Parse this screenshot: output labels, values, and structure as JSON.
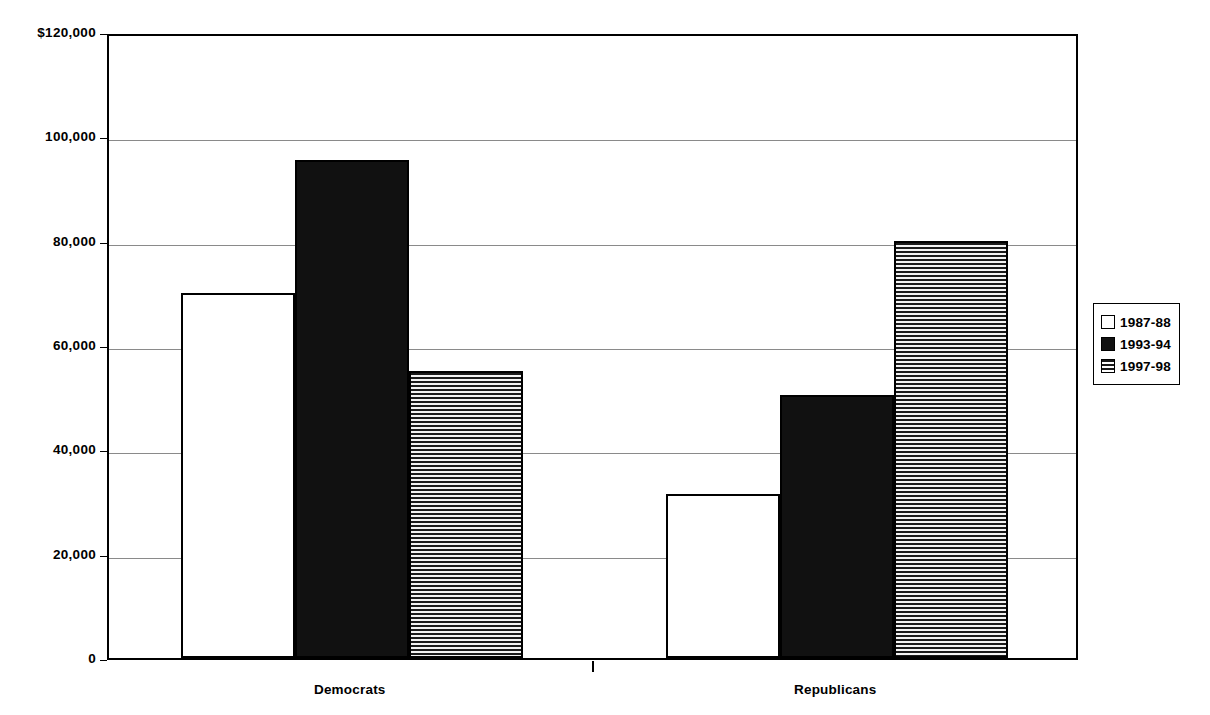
{
  "chart_data": {
    "type": "bar",
    "title": "",
    "subtitle": "",
    "xlabel": "",
    "ylabel": "",
    "categories": [
      "Democrats",
      "Republicans"
    ],
    "series": [
      {
        "name": "1987-88",
        "fill": "white",
        "values": [
          70000,
          31500
        ]
      },
      {
        "name": "1993-94",
        "fill": "black",
        "values": [
          95500,
          50500
        ]
      },
      {
        "name": "1997-98",
        "fill": "hatch",
        "values": [
          55000,
          80000
        ]
      }
    ],
    "ylim": [
      0,
      120000
    ],
    "ytick_values": [
      0,
      20000,
      40000,
      60000,
      80000,
      100000,
      120000
    ],
    "ytick_labels": [
      "0",
      "20,000",
      "40,000",
      "60,000",
      "80,000",
      "100,000",
      "$120,000"
    ],
    "grid": true,
    "grid_axis": "y",
    "legend_position": "right",
    "colors": {
      "axis": "#000000",
      "gridline": "#8a8a8a",
      "bar_outline": "#000000",
      "bar_white": "#ffffff",
      "bar_black": "#111111",
      "bar_hatch_line": "#1a1a1a",
      "background": "#ffffff"
    }
  },
  "legend": {
    "entries": [
      {
        "label": "1987-88"
      },
      {
        "label": "1993-94"
      },
      {
        "label": "1997-98"
      }
    ]
  }
}
